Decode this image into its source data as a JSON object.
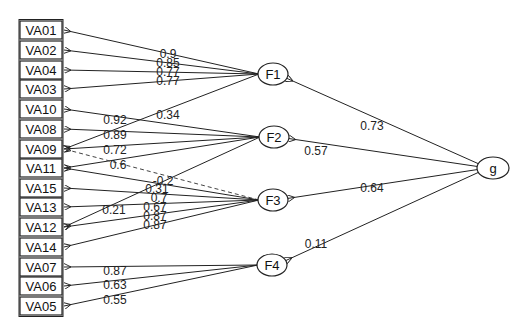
{
  "diagram": {
    "type": "bifactor-path-diagram",
    "observed": [
      {
        "id": "VA01",
        "label": "VA01",
        "y": 30
      },
      {
        "id": "VA02",
        "label": "VA02",
        "y": 50
      },
      {
        "id": "VA04",
        "label": "VA04",
        "y": 70
      },
      {
        "id": "VA03",
        "label": "VA03",
        "y": 89
      },
      {
        "id": "VA10",
        "label": "VA10",
        "y": 109
      },
      {
        "id": "VA08",
        "label": "VA08",
        "y": 129
      },
      {
        "id": "VA09",
        "label": "VA09",
        "y": 149
      },
      {
        "id": "VA11",
        "label": "VA11",
        "y": 168
      },
      {
        "id": "VA15",
        "label": "VA15",
        "y": 188
      },
      {
        "id": "VA13",
        "label": "VA13",
        "y": 207
      },
      {
        "id": "VA12",
        "label": "VA12",
        "y": 227
      },
      {
        "id": "VA14",
        "label": "VA14",
        "y": 247
      },
      {
        "id": "VA07",
        "label": "VA07",
        "y": 267
      },
      {
        "id": "VA06",
        "label": "VA06",
        "y": 286
      },
      {
        "id": "VA05",
        "label": "VA05",
        "y": 306
      }
    ],
    "latent": [
      {
        "id": "F1",
        "label": "F1",
        "cx": 273,
        "cy": 74
      },
      {
        "id": "F2",
        "label": "F2",
        "cx": 274,
        "cy": 137
      },
      {
        "id": "F3",
        "label": "F3",
        "cx": 273,
        "cy": 200
      },
      {
        "id": "F4",
        "label": "F4",
        "cx": 272,
        "cy": 265
      },
      {
        "id": "g",
        "label": "g",
        "cx": 493,
        "cy": 168
      }
    ],
    "loadings": [
      {
        "from": "F1",
        "to": "VA01",
        "value": "0.9",
        "lx": 168,
        "ly": 54
      },
      {
        "from": "F1",
        "to": "VA02",
        "value": "0.85",
        "lx": 168,
        "ly": 63
      },
      {
        "from": "F1",
        "to": "VA04",
        "value": "0.77",
        "lx": 168,
        "ly": 72
      },
      {
        "from": "F1",
        "to": "VA03",
        "value": "0.77",
        "lx": 168,
        "ly": 81
      },
      {
        "from": "F1",
        "to": "VA09",
        "value": "0.34",
        "lx": 168,
        "ly": 115
      },
      {
        "from": "F2",
        "to": "VA10",
        "value": "0.92",
        "lx": 115,
        "ly": 120
      },
      {
        "from": "F2",
        "to": "VA08",
        "value": "0.89",
        "lx": 115,
        "ly": 135
      },
      {
        "from": "F2",
        "to": "VA09",
        "value": "0.72",
        "lx": 115,
        "ly": 150
      },
      {
        "from": "F2",
        "to": "VA11",
        "value": "0.6",
        "lx": 118,
        "ly": 165
      },
      {
        "from": "F2",
        "to": "VA12",
        "value": "0.21",
        "lx": 114,
        "ly": 210
      },
      {
        "from": "F3",
        "to": "VA09",
        "value": "-0.2",
        "lx": 163,
        "ly": 181,
        "dashed": true
      },
      {
        "from": "F3",
        "to": "VA11",
        "value": "0.31",
        "lx": 157,
        "ly": 189
      },
      {
        "from": "F3",
        "to": "VA15",
        "value": "0.7",
        "lx": 159,
        "ly": 198
      },
      {
        "from": "F3",
        "to": "VA13",
        "value": "0.67",
        "lx": 155,
        "ly": 207
      },
      {
        "from": "F3",
        "to": "VA12",
        "value": "0.87",
        "lx": 155,
        "ly": 216
      },
      {
        "from": "F3",
        "to": "VA14",
        "value": "0.87",
        "lx": 155,
        "ly": 225
      },
      {
        "from": "F4",
        "to": "VA07",
        "value": "0.87",
        "lx": 115,
        "ly": 271
      },
      {
        "from": "F4",
        "to": "VA06",
        "value": "0.63",
        "lx": 115,
        "ly": 285
      },
      {
        "from": "F4",
        "to": "VA05",
        "value": "0.55",
        "lx": 115,
        "ly": 300
      },
      {
        "from": "g",
        "to": "F1",
        "value": "0.73",
        "lx": 372,
        "ly": 126
      },
      {
        "from": "g",
        "to": "F2",
        "value": "0.57",
        "lx": 316,
        "ly": 151
      },
      {
        "from": "g",
        "to": "F3",
        "value": "0.64",
        "lx": 372,
        "ly": 188
      },
      {
        "from": "g",
        "to": "F4",
        "value": "0.11",
        "lx": 316,
        "ly": 244
      }
    ]
  }
}
